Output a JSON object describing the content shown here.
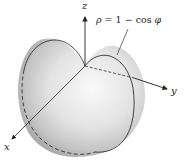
{
  "figure": {
    "equation": {
      "rho": "ρ",
      "equals": " = 1 − cos ",
      "phi": "φ"
    },
    "axes": {
      "z": "z",
      "y": "y",
      "x": "x"
    },
    "surface": "cardioid of revolution",
    "colors": {
      "surface_light": "#f4f4f4",
      "surface_dark": "#a9a9a9",
      "curve": "#333333",
      "axis": "#222222"
    }
  }
}
